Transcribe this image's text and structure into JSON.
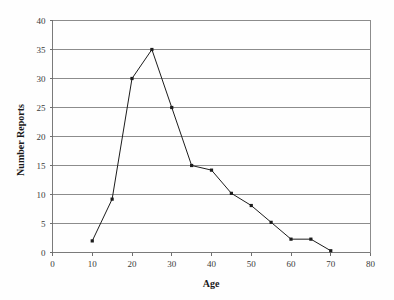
{
  "chart_data": {
    "type": "line",
    "title": "",
    "subtitle": "",
    "xlabel": "Age",
    "ylabel": "Number Reports",
    "xlim": [
      0,
      80
    ],
    "ylim": [
      0,
      40
    ],
    "xticks": [
      0,
      10,
      20,
      30,
      40,
      50,
      60,
      70,
      80
    ],
    "yticks": [
      0,
      5,
      10,
      15,
      20,
      25,
      30,
      35,
      40
    ],
    "xtick_labels": [
      "0",
      "10",
      "20",
      "30",
      "40",
      "50",
      "60",
      "70",
      "80"
    ],
    "ytick_labels": [
      "0",
      "5",
      "10",
      "15",
      "20",
      "25",
      "30",
      "35",
      "40"
    ],
    "grid": "horizontal",
    "legend": "none",
    "marker": "square",
    "line_color": "#1c1c1c",
    "grid_color": "#8c8c8c",
    "background_color": "#fefefe",
    "x": [
      10,
      15,
      20,
      25,
      30,
      35,
      40,
      45,
      50,
      55,
      60,
      65,
      70
    ],
    "values": [
      2,
      9.2,
      30,
      35,
      25,
      15,
      14.2,
      10.2,
      8.1,
      5.2,
      2.3,
      2.3,
      0.3
    ],
    "series": [
      {
        "name": "Number Reports",
        "x": [
          10,
          15,
          20,
          25,
          30,
          35,
          40,
          45,
          50,
          55,
          60,
          65,
          70
        ],
        "values": [
          2,
          9.2,
          30,
          35,
          25,
          15,
          14.2,
          10.2,
          8.1,
          5.2,
          2.3,
          2.3,
          0.3
        ]
      }
    ],
    "annotations": []
  },
  "axis": {
    "x_title": "Age",
    "y_title": "Number Reports"
  }
}
